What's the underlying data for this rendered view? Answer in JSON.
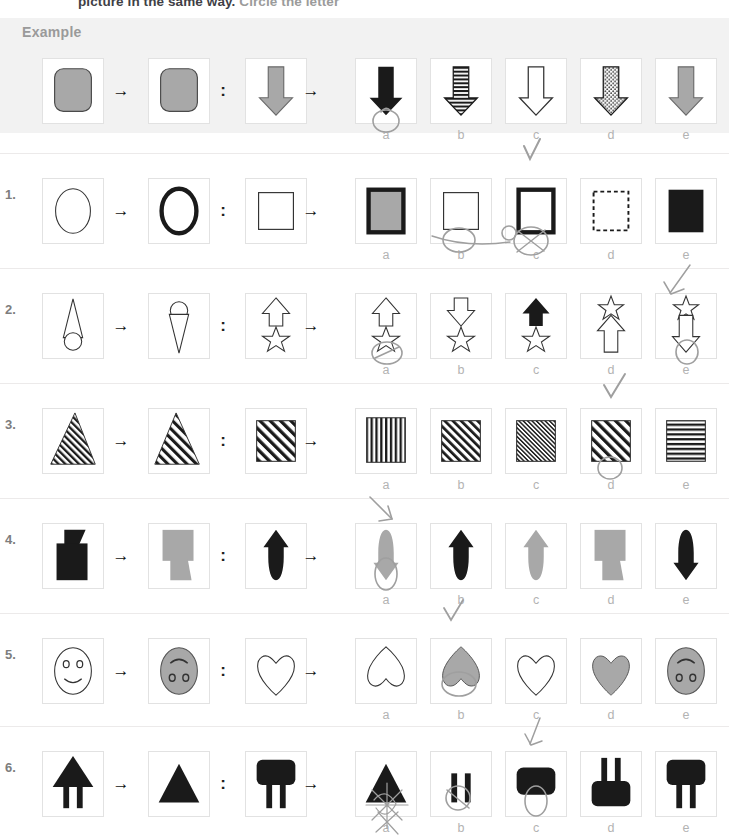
{
  "worksheet": {
    "instruction_partial": "picture in the same way.",
    "instruction_partial_grey": "Circle the letter",
    "example_label": "Example",
    "arrow_glyph": "→",
    "colon_glyph": ":",
    "option_letters": [
      "a",
      "b",
      "c",
      "d",
      "e"
    ],
    "colors": {
      "grey_fill": "#a8a8a8",
      "black_fill": "#1a1a1a",
      "band_bg": "#f2f2f2",
      "box_border": "#e2e2e2",
      "label_grey": "#b3b3b3",
      "rule_grey": "#eceaea",
      "pen_grey": "#9a9a9a"
    }
  },
  "rows": [
    {
      "number": "Example",
      "is_example": true,
      "prompt": [
        {
          "shape": "rounded-square",
          "fill": "grey",
          "name": "rounded-square-grey"
        },
        {
          "shape": "rounded-square",
          "fill": "black",
          "name": "rounded-square-black"
        },
        {
          "shape": "down-arrow",
          "fill": "grey",
          "name": "down-arrow-grey"
        }
      ],
      "options": [
        {
          "letter": "a",
          "shape": "down-arrow",
          "fill": "black",
          "name": "down-arrow-black"
        },
        {
          "letter": "b",
          "shape": "down-arrow",
          "fill": "h-stripes",
          "name": "down-arrow-striped"
        },
        {
          "letter": "c",
          "shape": "down-arrow",
          "fill": "white",
          "name": "down-arrow-white"
        },
        {
          "letter": "d",
          "shape": "down-arrow",
          "fill": "dots",
          "name": "down-arrow-dotted"
        },
        {
          "letter": "e",
          "shape": "down-arrow",
          "fill": "grey",
          "name": "down-arrow-grey"
        }
      ],
      "marked": "a"
    },
    {
      "number": "1.",
      "is_example": false,
      "prompt": [
        {
          "shape": "ellipse-thin",
          "fill": "white",
          "name": "ellipse-thin-outline"
        },
        {
          "shape": "ellipse-thick",
          "fill": "white",
          "name": "ellipse-thick-outline"
        },
        {
          "shape": "square-thin",
          "fill": "white",
          "name": "square-thin-outline"
        }
      ],
      "options": [
        {
          "letter": "a",
          "shape": "square-thick-grey",
          "fill": "grey",
          "name": "square-thick-grey-fill"
        },
        {
          "letter": "b",
          "shape": "square-thin",
          "fill": "white",
          "name": "square-thin-outline"
        },
        {
          "letter": "c",
          "shape": "square-thick",
          "fill": "white",
          "name": "square-thick-outline"
        },
        {
          "letter": "d",
          "shape": "square-dashed",
          "fill": "white",
          "name": "square-dashed-outline"
        },
        {
          "letter": "e",
          "shape": "square-solid",
          "fill": "black",
          "name": "square-solid-black"
        }
      ],
      "marked": "c"
    },
    {
      "number": "2.",
      "is_example": false,
      "prompt": [
        {
          "shape": "triangle-circle-up",
          "fill": "white",
          "name": "triangle-over-circle"
        },
        {
          "shape": "triangle-circle-down",
          "fill": "white",
          "name": "circle-over-triangle"
        },
        {
          "shape": "arrow-up-star",
          "fill": "white",
          "name": "up-arrow-over-star"
        }
      ],
      "options": [
        {
          "letter": "a",
          "shape": "arrow-up-star",
          "fill": "white",
          "name": "up-arrow-over-star"
        },
        {
          "letter": "b",
          "shape": "arrow-down-star",
          "fill": "white",
          "name": "down-arrow-over-star"
        },
        {
          "letter": "c",
          "shape": "arrow-up-black-star",
          "fill": "black",
          "name": "black-up-arrow-over-star"
        },
        {
          "letter": "d",
          "shape": "star-over-arrow-up",
          "fill": "white",
          "name": "star-over-up-arrow"
        },
        {
          "letter": "e",
          "shape": "star-over-arrow-down",
          "fill": "white",
          "name": "star-over-down-arrow"
        }
      ],
      "marked": "e"
    },
    {
      "number": "3.",
      "is_example": false,
      "prompt": [
        {
          "shape": "triangle-diag-stripes-narrow",
          "fill": "stripes",
          "name": "triangle-diagonal-stripes"
        },
        {
          "shape": "triangle-diag-stripes-wide",
          "fill": "stripes",
          "name": "triangle-diagonal-stripes-wide"
        },
        {
          "shape": "square-diag-stripes-wide",
          "fill": "stripes",
          "name": "square-diagonal-stripes-wide"
        }
      ],
      "options": [
        {
          "letter": "a",
          "shape": "square-vert-stripes",
          "fill": "stripes",
          "name": "square-vertical-stripes"
        },
        {
          "letter": "b",
          "shape": "square-diag-stripes-med",
          "fill": "stripes",
          "name": "square-diagonal-stripes-medium"
        },
        {
          "letter": "c",
          "shape": "square-diag-stripes-fine",
          "fill": "stripes",
          "name": "square-diagonal-stripes-fine"
        },
        {
          "letter": "d",
          "shape": "square-diag-stripes-wide",
          "fill": "stripes",
          "name": "square-diagonal-stripes-wide"
        },
        {
          "letter": "e",
          "shape": "square-horiz-stripes",
          "fill": "stripes",
          "name": "square-horizontal-stripes"
        }
      ],
      "marked": "d"
    },
    {
      "number": "4.",
      "is_example": false,
      "prompt": [
        {
          "shape": "lamp-black",
          "fill": "black",
          "name": "lamp-shape-black"
        },
        {
          "shape": "lamp-grey-flip",
          "fill": "grey",
          "name": "lamp-shape-grey-flipped"
        },
        {
          "shape": "bullet-up-black",
          "fill": "black",
          "name": "bullet-arrow-up-black"
        }
      ],
      "options": [
        {
          "letter": "a",
          "shape": "bullet-down-grey",
          "fill": "grey",
          "name": "bullet-arrow-down-grey"
        },
        {
          "letter": "b",
          "shape": "bullet-up-black",
          "fill": "black",
          "name": "bullet-arrow-up-black"
        },
        {
          "letter": "c",
          "shape": "bullet-up-grey",
          "fill": "grey",
          "name": "bullet-arrow-up-grey"
        },
        {
          "letter": "d",
          "shape": "lamp-grey-flip",
          "fill": "grey",
          "name": "lamp-shape-grey-flipped"
        },
        {
          "letter": "e",
          "shape": "bullet-down-black",
          "fill": "black",
          "name": "bullet-arrow-down-black"
        }
      ],
      "marked": "a"
    },
    {
      "number": "5.",
      "is_example": false,
      "prompt": [
        {
          "shape": "face-smile-white",
          "fill": "white",
          "name": "smiley-face-outline"
        },
        {
          "shape": "face-grey-flip",
          "fill": "grey",
          "name": "grey-face-flipped"
        },
        {
          "shape": "heart-white",
          "fill": "white",
          "name": "heart-outline"
        }
      ],
      "options": [
        {
          "letter": "a",
          "shape": "heart-inverted-white",
          "fill": "white",
          "name": "inverted-heart-outline"
        },
        {
          "letter": "b",
          "shape": "heart-inverted-grey",
          "fill": "grey",
          "name": "inverted-heart-grey"
        },
        {
          "letter": "c",
          "shape": "heart-white",
          "fill": "white",
          "name": "heart-outline"
        },
        {
          "letter": "d",
          "shape": "heart-grey",
          "fill": "grey",
          "name": "heart-grey"
        },
        {
          "letter": "e",
          "shape": "face-grey-flip",
          "fill": "grey",
          "name": "grey-face-flipped"
        }
      ],
      "marked": "b"
    },
    {
      "number": "6.",
      "is_example": false,
      "prompt": [
        {
          "shape": "tri-legs-black",
          "fill": "black",
          "name": "triangle-with-legs-black"
        },
        {
          "shape": "tri-black",
          "fill": "black",
          "name": "triangle-black"
        },
        {
          "shape": "rect-legs-black",
          "fill": "black",
          "name": "rounded-rect-with-legs-black"
        }
      ],
      "options": [
        {
          "letter": "a",
          "shape": "tri-black",
          "fill": "black",
          "name": "triangle-black"
        },
        {
          "letter": "b",
          "shape": "legs-only-black",
          "fill": "black",
          "name": "legs-only-black"
        },
        {
          "letter": "c",
          "shape": "rect-black",
          "fill": "black",
          "name": "rounded-rect-black"
        },
        {
          "letter": "d",
          "shape": "rect-legs-up-black",
          "fill": "black",
          "name": "rounded-rect-with-legs-up-black"
        },
        {
          "letter": "e",
          "shape": "rect-legs-black",
          "fill": "black",
          "name": "rounded-rect-with-legs-black"
        }
      ],
      "marked": "c"
    }
  ],
  "pen_marks": {
    "description": "handwritten pencil checkmarks, circles and scribbles over option letters",
    "color": "#9a9a9a"
  }
}
